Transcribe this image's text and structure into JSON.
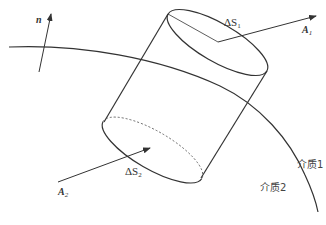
{
  "diagram": {
    "type": "boundary-cylinder",
    "labels": {
      "normal": "n",
      "top_area": "ΔS",
      "top_area_sub": "1",
      "bottom_area": "ΔS",
      "bottom_area_sub": "2",
      "vec_top": "A",
      "vec_top_sub": "1",
      "vec_bottom": "A",
      "vec_bottom_sub": "2",
      "medium1": "介质1",
      "medium2": "介质2"
    },
    "colors": {
      "stroke": "#333333",
      "background": "#ffffff"
    }
  }
}
